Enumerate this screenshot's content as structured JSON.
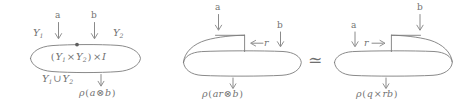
{
  "figure": {
    "name": "tensor-product-cobordism-equivalence",
    "background_color": "#ffffff",
    "ink_color": "#737373",
    "relation_symbol": "≃"
  },
  "left_diagram": {
    "name": "product-interval-blob",
    "top_labels": {
      "a": "a",
      "b": "b"
    },
    "side_labels": {
      "y1": "Y",
      "y1_sub": "1",
      "y2": "Y",
      "y2_sub": "2"
    },
    "interior_label": {
      "open_paren": "(",
      "y1": "Y",
      "y1_sub": "1",
      "times1": "×",
      "y2": "Y",
      "y2_sub": "2",
      "close_paren": ")",
      "times2": "×",
      "interval": "I",
      "full": "(Y₁ × Y₂) × I"
    },
    "union_label": {
      "y1": "Y",
      "y1_sub": "1",
      "cup": "∪",
      "y2": "Y",
      "y2_sub": "2",
      "full": "Y₁ ∪ Y₂"
    },
    "bottom_label": {
      "rho": "ρ",
      "open_paren": "(",
      "a": "a",
      "tensor": "⊗",
      "b": "b",
      "close_paren": ")",
      "full": "ρ(a ⊗ b)"
    }
  },
  "middle_diagram": {
    "name": "left-flap-blob",
    "top_label_a": "a",
    "top_label_b": "b",
    "flap_label": {
      "arrow": "←",
      "r": "r",
      "full": "← r"
    },
    "bottom_label": {
      "rho": "ρ",
      "open_paren": "(",
      "ar": "ar",
      "tensor": "⊗",
      "b": "b",
      "close_paren": ")",
      "full": "ρ(ar ⊗ b)"
    }
  },
  "right_diagram": {
    "name": "right-flap-blob",
    "top_label_a": "a",
    "top_label_b": "b",
    "flap_label": {
      "r": "r",
      "arrow": "→",
      "full": "r →"
    },
    "bottom_label": {
      "rho": "ρ",
      "open_paren": "(",
      "q": "q",
      "times": "×",
      "rb": "rb",
      "close_paren": ")",
      "full": "ρ(q × rb)"
    }
  }
}
